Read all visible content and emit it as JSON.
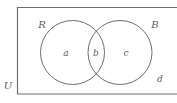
{
  "diagram": {
    "universe": {
      "label": "U",
      "outside_region_label": "d"
    },
    "sets": [
      {
        "id": "left",
        "label": "R"
      },
      {
        "id": "right",
        "label": "B"
      }
    ],
    "regions": [
      {
        "id": "left-only",
        "label": "a"
      },
      {
        "id": "intersection",
        "label": "b"
      },
      {
        "id": "right-only",
        "label": "c"
      }
    ],
    "colors": {
      "stroke": "#6e6e6e",
      "text": "#5b5b5b",
      "background": "#ffffff"
    }
  }
}
